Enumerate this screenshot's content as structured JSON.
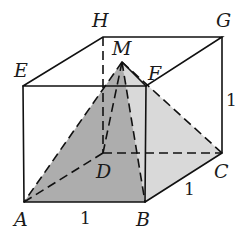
{
  "diagram": {
    "type": "cube-with-inscribed-pyramid",
    "vertices": {
      "A": {
        "label": "A",
        "x": 24,
        "y": 202
      },
      "B": {
        "label": "B",
        "x": 145,
        "y": 202
      },
      "C": {
        "label": "C",
        "x": 222,
        "y": 153
      },
      "D": {
        "label": "D",
        "x": 103,
        "y": 153
      },
      "E": {
        "label": "E",
        "x": 23,
        "y": 86
      },
      "F": {
        "label": "F",
        "x": 146,
        "y": 86
      },
      "G": {
        "label": "G",
        "x": 222,
        "y": 37
      },
      "H": {
        "label": "H",
        "x": 103,
        "y": 37
      },
      "M": {
        "label": "M",
        "x": 122,
        "y": 62
      }
    },
    "edge_lengths": {
      "AB": "1",
      "BC": "1",
      "CG": "1"
    },
    "shaded_faces": [
      {
        "name": "MAB",
        "color": "#a9a9a9"
      },
      {
        "name": "MBC",
        "color": "#d6d6d6"
      }
    ]
  }
}
